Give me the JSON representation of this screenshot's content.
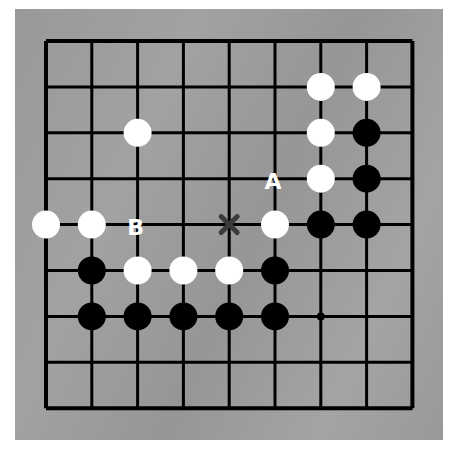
{
  "board": {
    "size": 9,
    "background_color": "#9d9d9d",
    "line_color": "#000000",
    "origin_x": 46,
    "origin_y": 41,
    "spacing_x": 45.8,
    "spacing_y": 45.9,
    "stone_radius": 14,
    "star_points": [
      {
        "col": 6,
        "row": 6
      }
    ]
  },
  "stones": [
    {
      "color": "white",
      "col": 6,
      "row": 1
    },
    {
      "color": "white",
      "col": 7,
      "row": 1
    },
    {
      "color": "white",
      "col": 2,
      "row": 2
    },
    {
      "color": "white",
      "col": 6,
      "row": 2
    },
    {
      "color": "black",
      "col": 7,
      "row": 2
    },
    {
      "color": "white",
      "col": 6,
      "row": 3
    },
    {
      "color": "black",
      "col": 7,
      "row": 3
    },
    {
      "color": "white",
      "col": 0,
      "row": 4
    },
    {
      "color": "white",
      "col": 1,
      "row": 4
    },
    {
      "color": "white",
      "col": 5,
      "row": 4
    },
    {
      "color": "black",
      "col": 6,
      "row": 4
    },
    {
      "color": "black",
      "col": 7,
      "row": 4
    },
    {
      "color": "black",
      "col": 1,
      "row": 5
    },
    {
      "color": "white",
      "col": 2,
      "row": 5
    },
    {
      "color": "white",
      "col": 3,
      "row": 5
    },
    {
      "color": "white",
      "col": 4,
      "row": 5
    },
    {
      "color": "black",
      "col": 5,
      "row": 5
    },
    {
      "color": "black",
      "col": 1,
      "row": 6
    },
    {
      "color": "black",
      "col": 2,
      "row": 6
    },
    {
      "color": "black",
      "col": 3,
      "row": 6
    },
    {
      "color": "black",
      "col": 4,
      "row": 6
    },
    {
      "color": "black",
      "col": 5,
      "row": 6
    }
  ],
  "labels": [
    {
      "text": "A",
      "col": 5,
      "row": 3,
      "color": "#ffffff"
    },
    {
      "text": "B",
      "col": 2,
      "row": 4,
      "color": "#ffffff"
    }
  ],
  "marks": [
    {
      "type": "x-mark",
      "col": 4,
      "row": 4,
      "color": "#3a3a3a"
    }
  ]
}
